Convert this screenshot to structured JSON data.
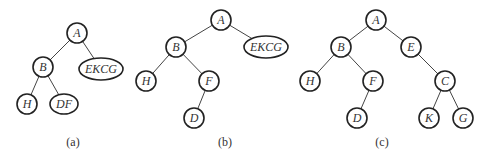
{
  "diagrams": [
    {
      "caption": "(a)",
      "caption_pos": [
        73,
        146
      ],
      "nodes": [
        {
          "id": "A",
          "label": "A",
          "x": 77,
          "y": 33,
          "rx": 10,
          "ry": 10
        },
        {
          "id": "B",
          "label": "B",
          "x": 43,
          "y": 67,
          "rx": 10,
          "ry": 10
        },
        {
          "id": "EKCG",
          "label": "EKCG",
          "x": 101,
          "y": 69,
          "rx": 22,
          "ry": 11
        },
        {
          "id": "H",
          "label": "H",
          "x": 27,
          "y": 104,
          "rx": 10,
          "ry": 10
        },
        {
          "id": "DF",
          "label": "DF",
          "x": 64,
          "y": 104,
          "rx": 14,
          "ry": 10
        }
      ],
      "edges": [
        [
          "A",
          "B"
        ],
        [
          "A",
          "EKCG"
        ],
        [
          "B",
          "H"
        ],
        [
          "B",
          "DF"
        ]
      ]
    },
    {
      "caption": "(b)",
      "caption_pos": [
        225,
        146
      ],
      "nodes": [
        {
          "id": "A",
          "label": "A",
          "x": 221,
          "y": 20,
          "rx": 10,
          "ry": 10
        },
        {
          "id": "B",
          "label": "B",
          "x": 176,
          "y": 47,
          "rx": 10,
          "ry": 10
        },
        {
          "id": "EKCG",
          "label": "EKCG",
          "x": 266,
          "y": 47,
          "rx": 22,
          "ry": 11
        },
        {
          "id": "H",
          "label": "H",
          "x": 146,
          "y": 81,
          "rx": 10,
          "ry": 10
        },
        {
          "id": "F",
          "label": "F",
          "x": 209,
          "y": 81,
          "rx": 10,
          "ry": 10
        },
        {
          "id": "D",
          "label": "D",
          "x": 194,
          "y": 118,
          "rx": 10,
          "ry": 10
        }
      ],
      "edges": [
        [
          "A",
          "B"
        ],
        [
          "A",
          "EKCG"
        ],
        [
          "B",
          "H"
        ],
        [
          "B",
          "F"
        ],
        [
          "F",
          "D"
        ]
      ]
    },
    {
      "caption": "(c)",
      "caption_pos": [
        382,
        146
      ],
      "nodes": [
        {
          "id": "A",
          "label": "A",
          "x": 376,
          "y": 20,
          "rx": 10,
          "ry": 10
        },
        {
          "id": "B",
          "label": "B",
          "x": 341,
          "y": 47,
          "rx": 10,
          "ry": 10
        },
        {
          "id": "E",
          "label": "E",
          "x": 411,
          "y": 47,
          "rx": 10,
          "ry": 10
        },
        {
          "id": "H",
          "label": "H",
          "x": 310,
          "y": 81,
          "rx": 10,
          "ry": 10
        },
        {
          "id": "F",
          "label": "F",
          "x": 373,
          "y": 81,
          "rx": 10,
          "ry": 10
        },
        {
          "id": "C",
          "label": "C",
          "x": 445,
          "y": 81,
          "rx": 10,
          "ry": 10
        },
        {
          "id": "D",
          "label": "D",
          "x": 357,
          "y": 118,
          "rx": 10,
          "ry": 10
        },
        {
          "id": "K",
          "label": "K",
          "x": 429,
          "y": 118,
          "rx": 10,
          "ry": 10
        },
        {
          "id": "G",
          "label": "G",
          "x": 463,
          "y": 118,
          "rx": 10,
          "ry": 10
        }
      ],
      "edges": [
        [
          "A",
          "B"
        ],
        [
          "A",
          "E"
        ],
        [
          "B",
          "H"
        ],
        [
          "B",
          "F"
        ],
        [
          "F",
          "D"
        ],
        [
          "E",
          "C"
        ],
        [
          "C",
          "K"
        ],
        [
          "C",
          "G"
        ]
      ]
    }
  ]
}
